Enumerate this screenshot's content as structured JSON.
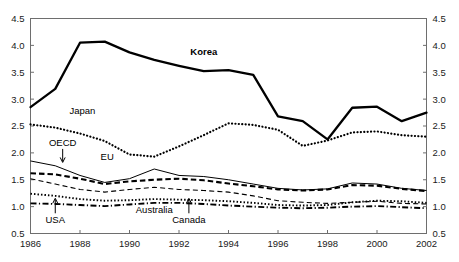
{
  "chart_data": {
    "type": "line",
    "title": "R&D expenditure (per cent of GDP)(a)",
    "xlabel": "",
    "ylabel": "",
    "x": [
      1986,
      1987,
      1988,
      1989,
      1990,
      1991,
      1992,
      1993,
      1994,
      1995,
      1996,
      1997,
      1998,
      1999,
      2000,
      2001,
      2002
    ],
    "xlim": [
      1986,
      2002
    ],
    "ylim": [
      0.5,
      4.5
    ],
    "ytick_labels": [
      "0.5",
      "1.0",
      "1.5",
      "2.0",
      "2.5",
      "3.0",
      "3.5",
      "4.0",
      "4.5"
    ],
    "ytick_values": [
      0.5,
      1.0,
      1.5,
      2.0,
      2.5,
      3.0,
      3.5,
      4.0,
      4.5
    ],
    "xtick_labels": [
      "1986",
      "1988",
      "1990",
      "1992",
      "1994",
      "1996",
      "1998",
      "2000",
      "2002"
    ],
    "xtick_values": [
      1986,
      1988,
      1990,
      1992,
      1994,
      1996,
      1998,
      2000,
      2002
    ],
    "grid": false,
    "legend": "inline-annotations",
    "dual_y_axis": true,
    "series": [
      {
        "name": "Korea",
        "style": "solid-thick",
        "label": "Korea",
        "label_bold": true,
        "values": [
          2.85,
          3.19,
          4.05,
          4.07,
          3.87,
          3.73,
          3.62,
          3.52,
          3.54,
          3.45,
          2.68,
          2.59,
          2.25,
          2.84,
          2.86,
          2.59,
          2.75
        ]
      },
      {
        "name": "Japan",
        "style": "dotted-round",
        "label": "Japan",
        "label_bold": false,
        "values": [
          2.53,
          2.47,
          2.36,
          2.22,
          1.97,
          1.93,
          2.12,
          2.33,
          2.55,
          2.52,
          2.43,
          2.13,
          2.23,
          2.38,
          2.4,
          2.33,
          2.3
        ]
      },
      {
        "name": "OECD",
        "style": "solid-thin",
        "label": "OECD",
        "label_bold": false,
        "values": [
          1.85,
          1.76,
          1.58,
          1.45,
          1.52,
          1.7,
          1.58,
          1.56,
          1.5,
          1.42,
          1.34,
          1.31,
          1.33,
          1.44,
          1.42,
          1.34,
          1.3
        ]
      },
      {
        "name": "EU",
        "style": "dashed-thick",
        "label": "EU",
        "label_bold": false,
        "values": [
          1.62,
          1.6,
          1.52,
          1.42,
          1.47,
          1.5,
          1.52,
          1.49,
          1.43,
          1.38,
          1.32,
          1.3,
          1.32,
          1.4,
          1.39,
          1.33,
          1.29
        ]
      },
      {
        "name": "Australia",
        "style": "dashed-thin",
        "label": "Australia",
        "label_bold": false,
        "values": [
          1.52,
          1.42,
          1.32,
          1.27,
          1.32,
          1.36,
          1.32,
          1.3,
          1.27,
          1.2,
          1.11,
          1.08,
          1.06,
          1.08,
          1.1,
          1.06,
          1.05
        ]
      },
      {
        "name": "Canada",
        "style": "dotted-square",
        "label": "Canada",
        "label_bold": false,
        "values": [
          1.24,
          1.2,
          1.14,
          1.11,
          1.12,
          1.14,
          1.13,
          1.12,
          1.1,
          1.07,
          1.03,
          1.02,
          1.03,
          1.08,
          1.11,
          1.1,
          1.07
        ]
      },
      {
        "name": "USA",
        "style": "dash-dot",
        "label": "USA",
        "label_bold": false,
        "values": [
          1.06,
          1.05,
          1.03,
          1.01,
          1.04,
          1.07,
          1.07,
          1.05,
          1.02,
          1.0,
          0.98,
          0.97,
          0.98,
          1.0,
          1.01,
          0.99,
          0.97
        ]
      }
    ],
    "annotations": [
      {
        "text": "Korea",
        "x": 1993.0,
        "y": 3.82,
        "bold": true
      },
      {
        "text": "Japan",
        "x": 1988.1,
        "y": 2.72,
        "bold": false
      },
      {
        "text": "OECD",
        "x": 1987.3,
        "y": 2.12,
        "bold": false,
        "arrow": "down"
      },
      {
        "text": "EU",
        "x": 1989.1,
        "y": 1.86,
        "bold": false
      },
      {
        "text": "Australia",
        "x": 1991.0,
        "y": 0.88,
        "bold": false
      },
      {
        "text": "USA",
        "x": 1987.0,
        "y": 0.69,
        "bold": false,
        "arrow": "up"
      },
      {
        "text": "Canada",
        "x": 1992.4,
        "y": 0.69,
        "bold": false,
        "arrow": "up"
      }
    ],
    "colors": {
      "line": "#000000",
      "axis": "#6e6e6e",
      "text": "#1a1a1a",
      "background": "#ffffff"
    }
  }
}
